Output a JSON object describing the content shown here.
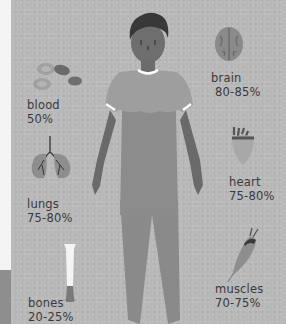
{
  "organs": {
    "brain": {
      "name": "brain",
      "percent": "80-85%",
      "icon": "brain-icon"
    },
    "blood": {
      "name": "blood",
      "percent": "50%",
      "icon": "blood-cells-icon"
    },
    "heart": {
      "name": "heart",
      "percent": "75-80%",
      "icon": "heart-icon"
    },
    "lungs": {
      "name": "lungs",
      "percent": "75-80%",
      "icon": "lungs-icon"
    },
    "muscles": {
      "name": "muscles",
      "percent": "70-75%",
      "icon": "muscle-icon"
    },
    "bones": {
      "name": "bones",
      "percent": "20-25%",
      "icon": "bone-icon"
    }
  },
  "colors": {
    "background": "#b8b8b8",
    "figure_body": "#8f8f8f",
    "figure_skin": "#6e6e6e",
    "hair": "#3a3a3a",
    "text": "#3a3a3a",
    "accent_white": "#ffffff"
  }
}
